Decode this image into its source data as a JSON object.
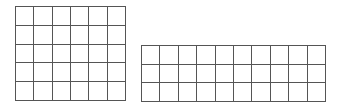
{
  "diagram": {
    "line_color": "#555555",
    "background": "#ffffff",
    "grids": [
      {
        "name": "grid-6x5",
        "columns": 6,
        "rows": 5,
        "x": 15,
        "y": 6,
        "width": 111,
        "height": 95
      },
      {
        "name": "grid-10x3",
        "columns": 10,
        "rows": 3,
        "x": 141,
        "y": 45,
        "width": 185,
        "height": 57
      }
    ]
  }
}
